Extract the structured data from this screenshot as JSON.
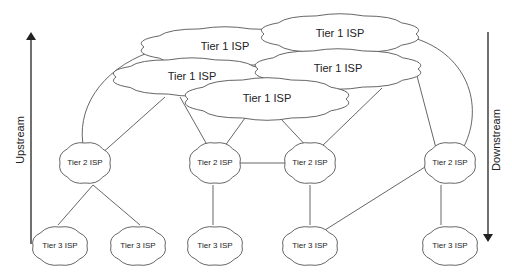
{
  "diagram": {
    "tier1": [
      {
        "id": "t1-a",
        "label": "Tier 1 ISP",
        "cx": 225,
        "cy": 47,
        "w": 162,
        "h": 38
      },
      {
        "id": "t1-b",
        "label": "Tier 1 ISP",
        "cx": 340,
        "cy": 34,
        "w": 152,
        "h": 38
      },
      {
        "id": "t1-c",
        "label": "Tier 1 ISP",
        "cx": 192,
        "cy": 77,
        "w": 152,
        "h": 36
      },
      {
        "id": "t1-d",
        "label": "Tier 1 ISP",
        "cx": 338,
        "cy": 69,
        "w": 160,
        "h": 38
      },
      {
        "id": "t1-e",
        "label": "Tier 1 ISP",
        "cx": 267,
        "cy": 99,
        "w": 158,
        "h": 40
      }
    ],
    "tier2": [
      {
        "id": "t2-1",
        "label": "Tier 2 ISP",
        "cx": 85,
        "cy": 163
      },
      {
        "id": "t2-2",
        "label": "Tier 2 ISP",
        "cx": 215,
        "cy": 163
      },
      {
        "id": "t2-3",
        "label": "Tier 2 ISP",
        "cx": 310,
        "cy": 163
      },
      {
        "id": "t2-4",
        "label": "Tier 2 ISP",
        "cx": 450,
        "cy": 163
      }
    ],
    "tier3": [
      {
        "id": "t3-1",
        "label": "Tier 3 ISP",
        "cx": 60,
        "cy": 246
      },
      {
        "id": "t3-2",
        "label": "Tier 3 ISP",
        "cx": 138,
        "cy": 246
      },
      {
        "id": "t3-3",
        "label": "Tier 3 ISP",
        "cx": 215,
        "cy": 246
      },
      {
        "id": "t3-4",
        "label": "Tier 3 ISP",
        "cx": 310,
        "cy": 246
      },
      {
        "id": "t3-5",
        "label": "Tier 3 ISP",
        "cx": 450,
        "cy": 246
      }
    ],
    "axes": {
      "upstream": "Upstream",
      "downstream": "Downstream"
    },
    "colors": {
      "stroke": "#555555",
      "arrow": "#222222",
      "text": "#222222"
    }
  }
}
